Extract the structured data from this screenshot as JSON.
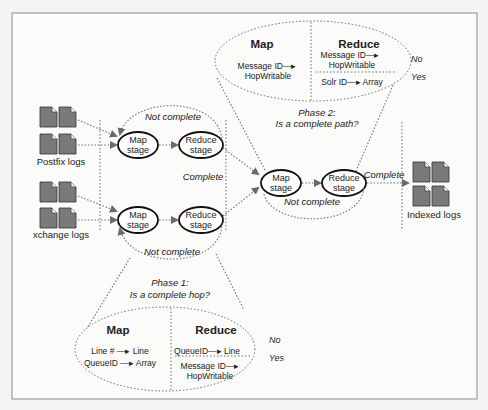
{
  "diagram": {
    "sources": [
      {
        "label": "Postfix logs"
      },
      {
        "label": "xchange logs"
      }
    ],
    "output": {
      "label": "Indexed logs"
    },
    "stages": {
      "map_label_1": "Map",
      "map_label_2": "stage",
      "reduce_label_1": "Reduce",
      "reduce_label_2": "stage"
    },
    "phase1": {
      "title_line1": "Phase 1:",
      "title_line2": "Is a complete hop?",
      "loop_not_complete_top": "Not complete",
      "loop_not_complete_bottom": "Not complete",
      "complete": "Complete",
      "map_header": "Map",
      "map_lines": [
        "Line # —▸ Line",
        "QueueID —▸ Array"
      ],
      "reduce_header": "Reduce",
      "reduce_no": [
        "QueueID—▸ Line"
      ],
      "reduce_yes": [
        "Message ID—▸",
        "HopWritable"
      ],
      "no_label": "No",
      "yes_label": "Yes"
    },
    "phase2": {
      "title_line1": "Phase 2:",
      "title_line2": "Is a complete path?",
      "not_complete": "Not complete",
      "complete": "Complete",
      "map_header": "Map",
      "map_lines": [
        "Message ID—▸",
        "HopWritable"
      ],
      "reduce_header": "Reduce",
      "reduce_no": [
        "Message ID—▸",
        "HopWritable"
      ],
      "reduce_yes": [
        "Solr ID—▸ Array"
      ],
      "no_label": "No",
      "yes_label": "Yes"
    },
    "colors": {
      "doc_fill": "#7a7a7a",
      "frame": "#8a8a8a",
      "stage_stroke": "#111111"
    }
  }
}
